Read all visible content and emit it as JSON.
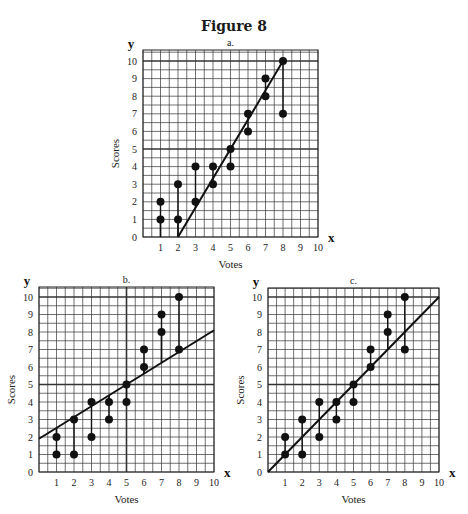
{
  "figure": {
    "title": "Figure 8"
  },
  "chart_data": [
    {
      "type": "scatter",
      "panel_label": "a.",
      "title": "a.",
      "xlabel": "Votes",
      "ylabel": "Scores",
      "x_axis_var": "x",
      "y_axis_var": "y",
      "xlim": [
        0,
        10
      ],
      "ylim": [
        0,
        10
      ],
      "x_ticks": [
        "1",
        "2",
        "3",
        "4",
        "5",
        "6",
        "7",
        "8",
        "9",
        "10"
      ],
      "y_ticks": [
        "0",
        "1",
        "2",
        "3",
        "4",
        "5",
        "6",
        "7",
        "8",
        "9",
        "10"
      ],
      "grid": true,
      "grid_minor_step": 0.5,
      "points": [
        [
          1,
          1
        ],
        [
          1,
          2
        ],
        [
          2,
          1
        ],
        [
          2,
          3
        ],
        [
          3,
          2
        ],
        [
          3,
          4
        ],
        [
          4,
          3
        ],
        [
          4,
          4
        ],
        [
          5,
          4
        ],
        [
          5,
          5
        ],
        [
          6,
          6
        ],
        [
          6,
          7
        ],
        [
          7,
          8
        ],
        [
          7,
          9
        ],
        [
          8,
          7
        ],
        [
          8,
          10
        ]
      ],
      "fit_line": {
        "x1": 2,
        "y1": 0,
        "x2": 8,
        "y2": 10
      },
      "residual_lines": "vertical segments from each point to the fit line"
    },
    {
      "type": "scatter",
      "panel_label": "b.",
      "title": "b.",
      "xlabel": "Votes",
      "ylabel": "Scores",
      "x_axis_var": "x",
      "y_axis_var": "y",
      "xlim": [
        0,
        10
      ],
      "ylim": [
        0,
        10
      ],
      "x_ticks": [
        "1",
        "2",
        "3",
        "4",
        "5",
        "6",
        "7",
        "8",
        "9",
        "10"
      ],
      "y_ticks": [
        "0",
        "1",
        "2",
        "3",
        "4",
        "5",
        "6",
        "7",
        "8",
        "9",
        "10"
      ],
      "grid": true,
      "grid_minor_step": 0.5,
      "points": [
        [
          1,
          1
        ],
        [
          1,
          2
        ],
        [
          2,
          1
        ],
        [
          2,
          3
        ],
        [
          3,
          2
        ],
        [
          3,
          4
        ],
        [
          4,
          3
        ],
        [
          4,
          4
        ],
        [
          5,
          4
        ],
        [
          5,
          5
        ],
        [
          6,
          6
        ],
        [
          6,
          7
        ],
        [
          7,
          8
        ],
        [
          7,
          9
        ],
        [
          8,
          7
        ],
        [
          8,
          10
        ]
      ],
      "fit_line": {
        "x1": 0,
        "y1": 1.9,
        "x2": 10,
        "y2": 8.1
      },
      "residual_lines": "vertical segments from each point to the fit line"
    },
    {
      "type": "scatter",
      "panel_label": "c.",
      "title": "c.",
      "xlabel": "Votes",
      "ylabel": "Scores",
      "x_axis_var": "x",
      "y_axis_var": "y",
      "xlim": [
        0,
        10
      ],
      "ylim": [
        0,
        10
      ],
      "x_ticks": [
        "1",
        "2",
        "3",
        "4",
        "5",
        "6",
        "7",
        "8",
        "9",
        "10"
      ],
      "y_ticks": [
        "0",
        "1",
        "2",
        "3",
        "4",
        "5",
        "6",
        "7",
        "8",
        "9",
        "10"
      ],
      "grid": true,
      "grid_minor_step": 0.5,
      "points": [
        [
          1,
          1
        ],
        [
          1,
          2
        ],
        [
          2,
          1
        ],
        [
          2,
          3
        ],
        [
          3,
          2
        ],
        [
          3,
          4
        ],
        [
          4,
          3
        ],
        [
          4,
          4
        ],
        [
          5,
          4
        ],
        [
          5,
          5
        ],
        [
          6,
          6
        ],
        [
          6,
          7
        ],
        [
          7,
          8
        ],
        [
          7,
          9
        ],
        [
          8,
          7
        ],
        [
          8,
          10
        ]
      ],
      "fit_line": {
        "x1": 0,
        "y1": 0,
        "x2": 10,
        "y2": 10
      },
      "residual_lines": "vertical segments from each point to the fit line"
    }
  ]
}
